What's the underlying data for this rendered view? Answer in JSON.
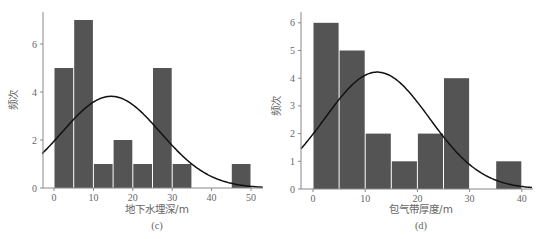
{
  "chart_data": [
    {
      "type": "bar",
      "subtype": "histogram_with_normal_curve",
      "caption": "(c)",
      "xlabel": "地下水埋深/m",
      "ylabel": "频次",
      "xlim": [
        -3,
        53
      ],
      "ylim": [
        0,
        7.4
      ],
      "xticks": [
        0,
        10,
        20,
        30,
        40,
        50
      ],
      "yticks": [
        0,
        2,
        4,
        6
      ],
      "bin_width": 5,
      "bins": [
        {
          "start": 0,
          "end": 5,
          "count": 5
        },
        {
          "start": 5,
          "end": 10,
          "count": 7
        },
        {
          "start": 10,
          "end": 15,
          "count": 1
        },
        {
          "start": 15,
          "end": 20,
          "count": 2
        },
        {
          "start": 20,
          "end": 25,
          "count": 1
        },
        {
          "start": 25,
          "end": 30,
          "count": 5
        },
        {
          "start": 30,
          "end": 35,
          "count": 1
        },
        {
          "start": 45,
          "end": 50,
          "count": 1
        }
      ],
      "normal_curve": {
        "mean": 14.5,
        "sd": 12.5,
        "peak": 3.82
      },
      "grid": false,
      "bar_color": "#545454",
      "curve_color": "#111111"
    },
    {
      "type": "bar",
      "subtype": "histogram_with_normal_curve",
      "caption": "(d)",
      "xlabel": "包气带厚度/m",
      "ylabel": "频次",
      "xlim": [
        -2.3,
        42
      ],
      "ylim": [
        0,
        6.4
      ],
      "xticks": [
        0,
        10,
        20,
        30,
        40
      ],
      "yticks": [
        0,
        1,
        2,
        3,
        4,
        5,
        6
      ],
      "bin_width": 5,
      "bins": [
        {
          "start": 0,
          "end": 5,
          "count": 6
        },
        {
          "start": 5,
          "end": 10,
          "count": 5
        },
        {
          "start": 10,
          "end": 15,
          "count": 2
        },
        {
          "start": 15,
          "end": 20,
          "count": 1
        },
        {
          "start": 20,
          "end": 25,
          "count": 2
        },
        {
          "start": 25,
          "end": 30,
          "count": 4
        },
        {
          "start": 35,
          "end": 40,
          "count": 1
        }
      ],
      "normal_curve": {
        "mean": 12.3,
        "sd": 10.0,
        "peak": 4.22
      },
      "grid": false,
      "bar_color": "#545454",
      "curve_color": "#111111"
    }
  ]
}
